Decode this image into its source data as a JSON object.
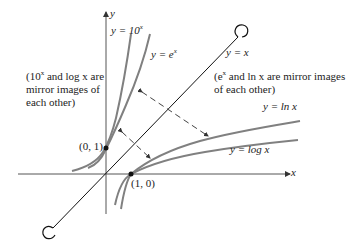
{
  "figure": {
    "axes": {
      "x_label": "x",
      "y_label": "y"
    },
    "curves": [
      {
        "id": "pow10",
        "label_prefix": "y = 10",
        "label_sup": "x"
      },
      {
        "id": "exp",
        "label_prefix": "y = e",
        "label_sup": "x"
      },
      {
        "id": "identity",
        "label": "y = x"
      },
      {
        "id": "ln",
        "label": "y = ln x"
      },
      {
        "id": "log",
        "label": "y = log x"
      }
    ],
    "points": [
      {
        "label": "(0, 1)"
      },
      {
        "label": "(1, 0)"
      }
    ],
    "notes": {
      "left": {
        "line1_pre": "(10",
        "line1_sup": "x",
        "line1_post": " and log x are",
        "line2": "mirror images of",
        "line3": "each other)"
      },
      "right": {
        "line1_pre": "(e",
        "line1_sup": "x",
        "line1_post": " and ln x are mirror images",
        "line2": "of each other)"
      }
    },
    "colors": {
      "curve": "#7a7a7a",
      "axis": "#444444",
      "line": "#111111"
    }
  }
}
